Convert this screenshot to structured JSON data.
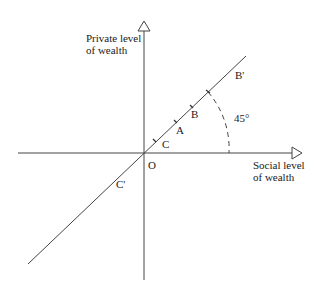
{
  "diagram": {
    "axes": {
      "y_label": "Private level\nof wealth",
      "x_label": "Social level\nof wealth",
      "origin_label": "O"
    },
    "points": [
      {
        "id": "B_prime",
        "label": "B'"
      },
      {
        "id": "B",
        "label": "B"
      },
      {
        "id": "A",
        "label": "A"
      },
      {
        "id": "C",
        "label": "C"
      },
      {
        "id": "C_prime",
        "label": "C'"
      }
    ],
    "angle_label": "45°",
    "colors": {
      "line": "#333333",
      "text": "#1a1a1a",
      "background": "#ffffff"
    }
  }
}
